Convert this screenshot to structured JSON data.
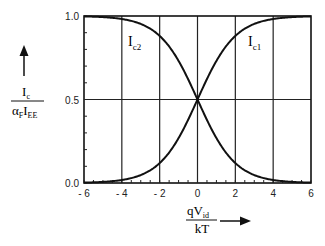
{
  "chart_data": {
    "type": "line",
    "title": "",
    "xlabel": "qV_id / kT",
    "ylabel": "I_c / (α_F I_EE)",
    "xlim": [
      -6,
      6
    ],
    "ylim": [
      0,
      1
    ],
    "x_ticks": [
      "- 6",
      "- 4",
      "- 2",
      "0",
      "2",
      "4",
      "6"
    ],
    "y_ticks": [
      "0.0",
      "0.5",
      "1.0"
    ],
    "grid": "vertical lines at every 2 units, horizontal line at 0.5",
    "legend": "inline labels",
    "x": [
      -6,
      -5,
      -4,
      -3,
      -2,
      -1,
      0,
      1,
      2,
      3,
      4,
      5,
      6
    ],
    "series": [
      {
        "name": "I_c1",
        "values": [
          0.002,
          0.007,
          0.018,
          0.047,
          0.119,
          0.269,
          0.5,
          0.731,
          0.881,
          0.953,
          0.982,
          0.993,
          0.998
        ]
      },
      {
        "name": "I_c2",
        "values": [
          0.998,
          0.993,
          0.982,
          0.953,
          0.881,
          0.731,
          0.5,
          0.269,
          0.119,
          0.047,
          0.018,
          0.007,
          0.002
        ]
      }
    ]
  },
  "labels": {
    "ic1_main": "I",
    "ic1_sub": "c1",
    "ic2_main": "I",
    "ic2_sub": "c2",
    "y_num_main": "I",
    "y_num_sub": "c",
    "y_den_alpha": "α",
    "y_den_alpha_sub": "F",
    "y_den_i": "I",
    "y_den_i_sub": "EE",
    "x_num_q": "qV",
    "x_num_sub": "id",
    "x_den": "kT"
  }
}
